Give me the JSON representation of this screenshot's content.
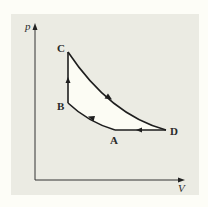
{
  "diagram": {
    "type": "pV-cycle",
    "axes": {
      "y_label": "p",
      "x_label": "V"
    },
    "points": {
      "A": {
        "label": "A"
      },
      "B": {
        "label": "B"
      },
      "C": {
        "label": "C"
      },
      "D": {
        "label": "D"
      }
    },
    "path_order": [
      "A",
      "B",
      "C",
      "D",
      "A"
    ],
    "segments": [
      {
        "from": "A",
        "to": "B",
        "shape": "curve",
        "direction": "up-left"
      },
      {
        "from": "B",
        "to": "C",
        "shape": "vertical line",
        "direction": "up"
      },
      {
        "from": "C",
        "to": "D",
        "shape": "curve",
        "direction": "down-right"
      },
      {
        "from": "D",
        "to": "A",
        "shape": "horizontal line",
        "direction": "left"
      }
    ],
    "colors": {
      "page_background": "#fdfdf7",
      "panel_background": "#ebebe3",
      "cycle_fill": "#fcfcf4",
      "line": "#1e1e1e"
    }
  }
}
